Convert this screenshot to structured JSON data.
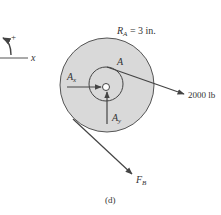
{
  "figure": {
    "caption": "(d)",
    "colors": {
      "disk_fill": "#d9d9d9",
      "stroke": "#444444",
      "text": "#333333",
      "background": "#ffffff"
    }
  },
  "sign_convention": {
    "axis_label": "x",
    "rotation_sign": "+"
  },
  "disk": {
    "radius_label_symbol": "R",
    "radius_label_subscript": "A",
    "radius_label_value": " = 3 in."
  },
  "point_label": "A",
  "forces": {
    "ax": {
      "symbol": "A",
      "subscript": "x"
    },
    "ay": {
      "symbol": "A",
      "subscript": "y"
    },
    "applied": {
      "label": "2000 lb"
    },
    "fb": {
      "symbol": "F",
      "subscript": "B"
    }
  }
}
